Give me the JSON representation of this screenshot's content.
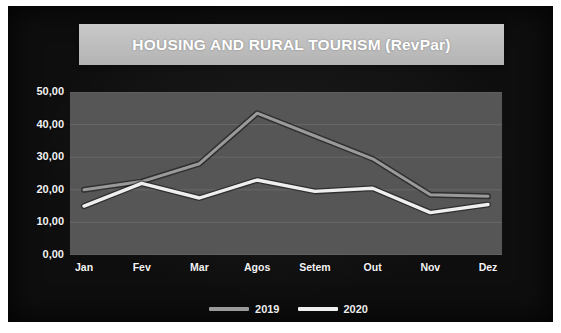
{
  "chart_data": {
    "type": "line",
    "title": "HOUSING AND RURAL TOURISM (RevPar)",
    "xlabel": "",
    "ylabel": "",
    "categories": [
      "Jan",
      "Fev",
      "Mar",
      "Agos",
      "Setem",
      "Out",
      "Nov",
      "Dez"
    ],
    "series": [
      {
        "name": "2019",
        "values": [
          20.0,
          22.5,
          28.0,
          43.5,
          36.5,
          29.5,
          18.5,
          18.0
        ],
        "color": "#9a9a9a"
      },
      {
        "name": "2020",
        "values": [
          15.0,
          22.0,
          17.5,
          23.0,
          19.5,
          20.5,
          13.0,
          15.5
        ],
        "color": "#efefef"
      }
    ],
    "ylim": [
      0,
      50
    ],
    "ytick_labels": [
      "50,00",
      "40,00",
      "30,00",
      "20,00",
      "10,00",
      "0,00"
    ],
    "ytick_values": [
      50,
      40,
      30,
      20,
      10,
      0
    ],
    "grid": true,
    "legend_position": "bottom"
  },
  "chart": {
    "title": "HOUSING AND RURAL TOURISM (RevPar)",
    "legend": [
      {
        "label": "2019"
      },
      {
        "label": "2020"
      }
    ]
  },
  "colors": {
    "slide_background": "#0d0d0d",
    "plot_background": "#565656",
    "title_band": "#c0c0c0",
    "title_text": "#ffffff",
    "axis_text": "#f2f2f2",
    "series_2019": "#9a9a9a",
    "series_2020": "#efefef",
    "gridline": "#6e6e6e"
  }
}
